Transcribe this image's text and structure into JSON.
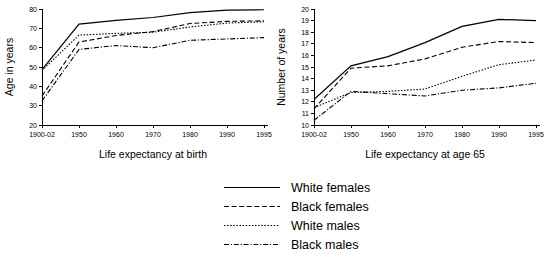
{
  "chart_data": [
    {
      "type": "line",
      "title": "",
      "xlabel": "Life expectancy at birth",
      "ylabel": "Age in years",
      "x": [
        "1900-02",
        "1950",
        "1960",
        "1970",
        "1980",
        "1990",
        "1995"
      ],
      "xlim": [
        0,
        6
      ],
      "ylim": [
        20,
        80
      ],
      "yticks": [
        20,
        30,
        40,
        50,
        60,
        70,
        80
      ],
      "grid": false,
      "series": [
        {
          "name": "White females",
          "style": "solid",
          "values": [
            48.7,
            72.2,
            74.1,
            75.6,
            78.1,
            79.4,
            79.6
          ]
        },
        {
          "name": "Black females",
          "style": "dashed",
          "values": [
            35.0,
            62.9,
            66.3,
            68.3,
            72.5,
            73.6,
            73.9
          ]
        },
        {
          "name": "White males",
          "style": "dotted",
          "values": [
            48.2,
            66.5,
            67.4,
            68.0,
            70.7,
            72.7,
            73.4
          ]
        },
        {
          "name": "Black males",
          "style": "dashdot",
          "values": [
            32.5,
            59.1,
            61.1,
            60.0,
            63.8,
            64.5,
            65.2
          ]
        }
      ]
    },
    {
      "type": "line",
      "title": "",
      "xlabel": "Life expectancy at age 65",
      "ylabel": "Number of years",
      "x": [
        "1900-02",
        "1950",
        "1960",
        "1970",
        "1980",
        "1990",
        "1995"
      ],
      "xlim": [
        0,
        6
      ],
      "ylim": [
        10,
        20
      ],
      "yticks": [
        10,
        11,
        12,
        13,
        14,
        15,
        16,
        17,
        18,
        19,
        20
      ],
      "grid": false,
      "series": [
        {
          "name": "White females",
          "style": "solid",
          "values": [
            12.2,
            15.1,
            15.9,
            17.1,
            18.5,
            19.1,
            19.0
          ]
        },
        {
          "name": "Black females",
          "style": "dashed",
          "values": [
            11.4,
            14.9,
            15.1,
            15.7,
            16.7,
            17.2,
            17.1
          ]
        },
        {
          "name": "White males",
          "style": "dotted",
          "values": [
            11.5,
            12.8,
            12.9,
            13.1,
            14.2,
            15.2,
            15.6
          ]
        },
        {
          "name": "Black males",
          "style": "dashdot",
          "values": [
            10.4,
            12.9,
            12.7,
            12.5,
            13.0,
            13.2,
            13.6
          ]
        }
      ]
    }
  ],
  "legend": {
    "position": "below-center",
    "items": [
      {
        "label": "White females",
        "style": "solid"
      },
      {
        "label": "Black females",
        "style": "dashed"
      },
      {
        "label": "White males",
        "style": "dotted"
      },
      {
        "label": "Black males",
        "style": "dashdot"
      }
    ]
  }
}
